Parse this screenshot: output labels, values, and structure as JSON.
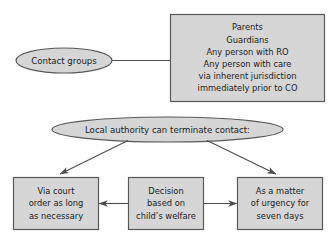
{
  "diagram": {
    "style": {
      "shape_fill": "#d6d6d6",
      "shape_stroke": "#595959",
      "connector_stroke": "#4d4d4d",
      "background": "#ffffff",
      "text_color": "#1b1b1b"
    },
    "nodes": {
      "contact_groups": {
        "shape": "ellipse",
        "label": "Contact groups"
      },
      "contact_persons": {
        "shape": "rectangle",
        "lines": [
          "Parents",
          "Guardians",
          "Any person with RO",
          "Any person with care",
          "via inherent jurisdiction",
          "immediately prior to CO"
        ]
      },
      "local_authority": {
        "shape": "ellipse",
        "label": "Local authority can terminate contact:"
      },
      "court_order": {
        "shape": "rectangle",
        "lines": [
          "Via court",
          "order as long",
          "as necessary"
        ]
      },
      "decision": {
        "shape": "rectangle",
        "lines": [
          "Decision",
          "based on",
          "child’s welfare"
        ]
      },
      "urgency": {
        "shape": "rectangle",
        "lines": [
          "As a matter",
          "of urgency for",
          "seven days"
        ]
      }
    },
    "connectors": [
      {
        "name": "contact-groups-to-persons",
        "from": "contact_groups",
        "to": "contact_persons",
        "arrowhead": "none",
        "kind": "line"
      },
      {
        "name": "local-authority-to-court-order",
        "from": "local_authority",
        "to": "court_order",
        "arrowhead": "end",
        "kind": "diagonal"
      },
      {
        "name": "local-authority-to-urgency",
        "from": "local_authority",
        "to": "urgency",
        "arrowhead": "end",
        "kind": "diagonal"
      },
      {
        "name": "decision-to-court-order",
        "from": "decision",
        "to": "court_order",
        "arrowhead": "end",
        "kind": "horizontal"
      },
      {
        "name": "decision-to-urgency",
        "from": "decision",
        "to": "urgency",
        "arrowhead": "end",
        "kind": "horizontal"
      }
    ]
  }
}
